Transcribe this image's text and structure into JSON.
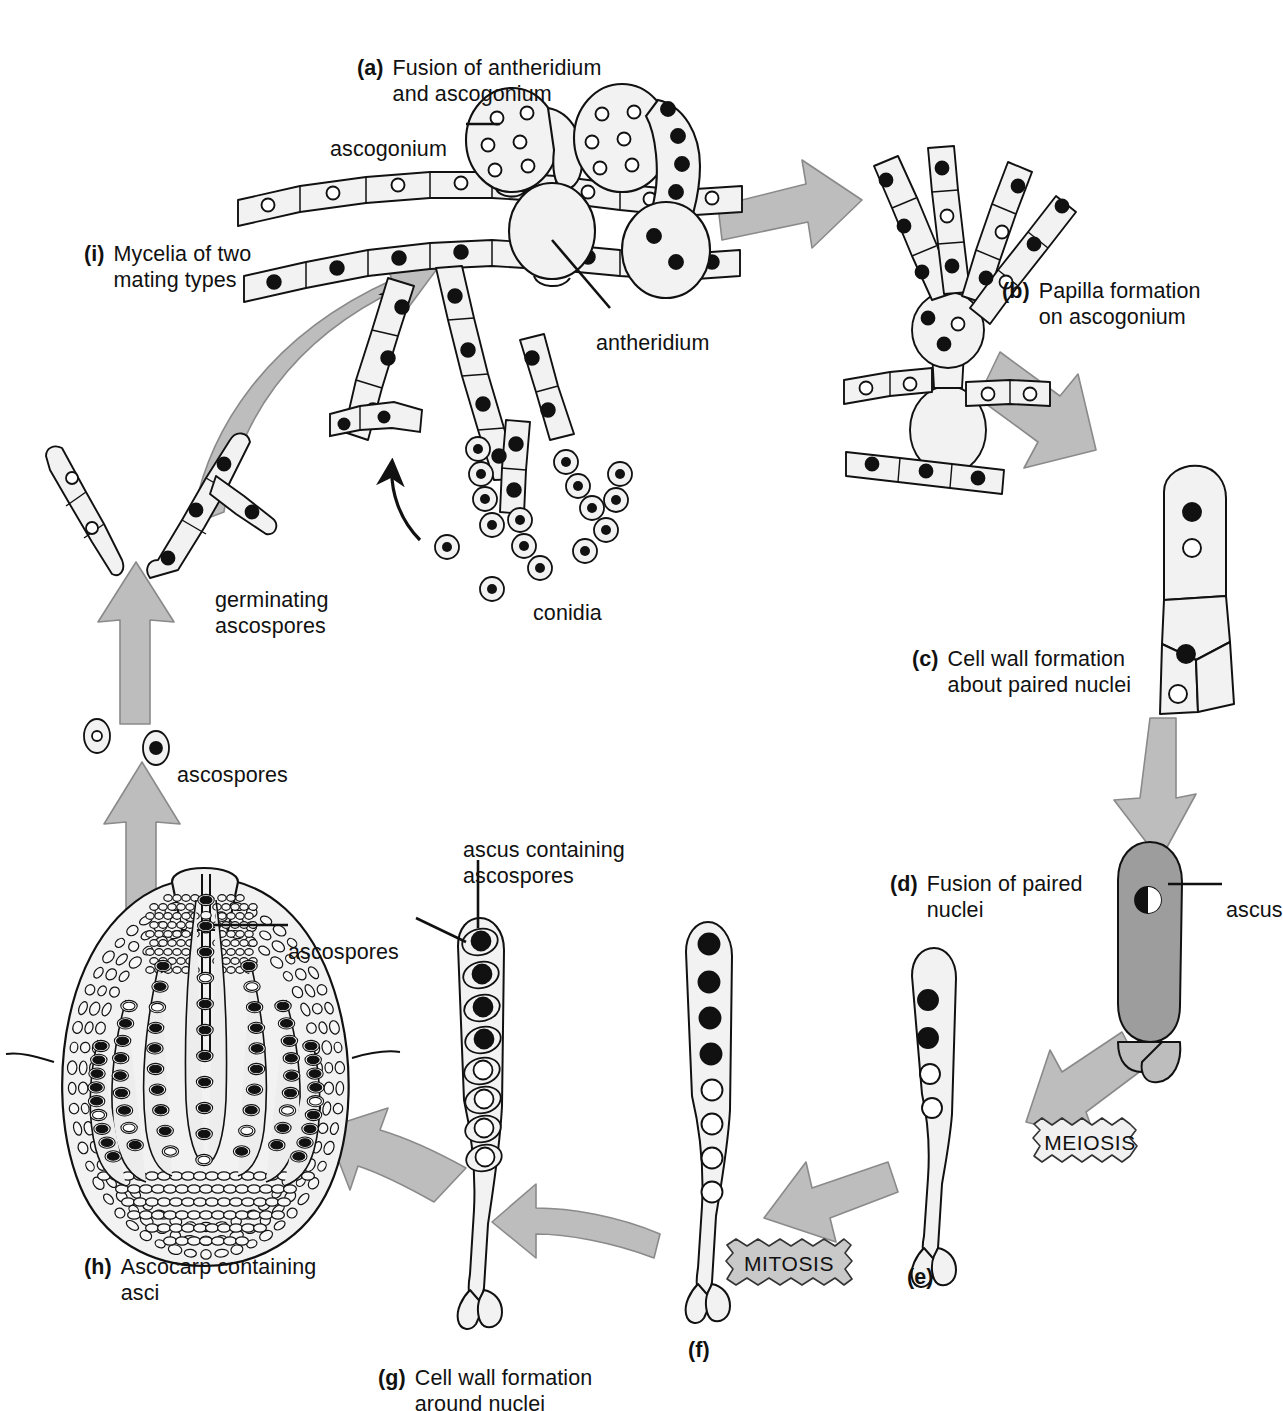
{
  "figure": {
    "type": "cycle-diagram",
    "background": "#ffffff",
    "line_color": "#111111",
    "arrow_fill": "#b9b9b9",
    "arrow_stroke": "#6f6f6f",
    "cell_fill": "#f2f2f2",
    "ascus_fill": "#9d9d9d",
    "nucleus_dark": "#111111",
    "nucleus_light": "#ffffff"
  },
  "steps": [
    {
      "key": "a",
      "letter": "(a)",
      "text": "Fusion of antheridium\nand ascogonium"
    },
    {
      "key": "b",
      "letter": "(b)",
      "text": "Papilla formation\non ascogonium"
    },
    {
      "key": "c",
      "letter": "(c)",
      "text": "Cell wall formation\nabout paired nuclei"
    },
    {
      "key": "d",
      "letter": "(d)",
      "text": "Fusion of paired\nnuclei"
    },
    {
      "key": "e",
      "letter": "(e)",
      "text": ""
    },
    {
      "key": "f",
      "letter": "(f)",
      "text": ""
    },
    {
      "key": "g",
      "letter": "(g)",
      "text": "Cell wall formation\naround nuclei"
    },
    {
      "key": "h",
      "letter": "(h)",
      "text": "Ascocarp containing\nasci"
    },
    {
      "key": "i",
      "letter": "(i)",
      "text": "Mycelia of two\nmating types"
    }
  ],
  "callouts": [
    {
      "key": "ascogonium",
      "text": "ascogonium"
    },
    {
      "key": "antheridium",
      "text": "antheridium"
    },
    {
      "key": "ascus",
      "text": "ascus"
    },
    {
      "key": "conidia",
      "text": "conidia"
    },
    {
      "key": "ascospores_free",
      "text": "ascospores"
    },
    {
      "key": "germinating",
      "text": "germinating\nascospores"
    },
    {
      "key": "ascus_containing",
      "text": "ascus containing\nascospores"
    },
    {
      "key": "ascospores_ascocarp",
      "text": "ascospores"
    }
  ],
  "process_boxes": [
    {
      "key": "meiosis",
      "label": "MEIOSIS",
      "fill": "#f0f0f0"
    },
    {
      "key": "mitosis",
      "label": "MITOSIS",
      "fill": "#c9c9c9"
    }
  ],
  "nuclei_counts": {
    "e_dark": 2,
    "e_light": 2,
    "f_dark": 4,
    "f_light": 4,
    "g_dark_spores": 4,
    "g_light_spores": 4
  }
}
